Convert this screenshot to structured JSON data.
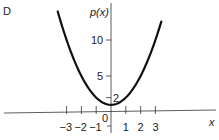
{
  "chart_data": {
    "type": "line",
    "panel_label": "D",
    "title": "",
    "xlabel": "x",
    "ylabel": "p(x)",
    "function": "x^2 + 1",
    "xlim": [
      -4,
      4.3
    ],
    "ylim": [
      -2,
      15
    ],
    "x_ticks": [
      -3,
      -2,
      -1,
      1,
      2,
      3
    ],
    "x_tick_labels": [
      "−3",
      "−2",
      "−1",
      "1",
      "2",
      "3"
    ],
    "origin_label": "0",
    "y_ticks": [
      2,
      5,
      10
    ],
    "y_tick_labels": [
      "2",
      "5",
      "10"
    ],
    "grid": false,
    "series": [
      {
        "name": "p(x)",
        "x": [
          -3.6,
          -3,
          -2.5,
          -2,
          -1.5,
          -1,
          -0.5,
          0,
          0.5,
          1,
          1.5,
          2,
          2.5,
          3,
          3.4
        ],
        "values": [
          13.96,
          10,
          7.25,
          5,
          3.25,
          2,
          1.25,
          1,
          1.25,
          2,
          3.25,
          5,
          7.25,
          10,
          12.56
        ]
      }
    ]
  }
}
